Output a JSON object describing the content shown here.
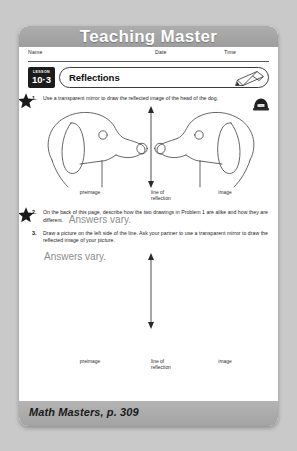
{
  "banner": {
    "title": "Teaching Master"
  },
  "fields": {
    "name_label": "Name",
    "date_label": "Date",
    "time_label": "Time"
  },
  "lesson": {
    "word": "LESSON",
    "number": "10·3",
    "title": "Reflections",
    "pencil_icon": "pencil-icon"
  },
  "problems": [
    {
      "number": "1.",
      "text": "Use a transparent mirror to draw the reflected image of the head of the dog.",
      "icon": "transparent-mirror-icon"
    },
    {
      "number": "2.",
      "text": "On the back of this page, describe how the two drawings in Problem 1 are alike and how they are different.",
      "answer": "Answers vary."
    },
    {
      "number": "3.",
      "text": "Draw a picture on the left side of the line. Ask your partner to use a transparent mirror to draw the reflected image of your picture.",
      "answer": "Answers vary."
    }
  ],
  "diagram_labels": {
    "preimage": "preimage",
    "line_of": "line of",
    "reflection": "reflection",
    "image": "image"
  },
  "footer": {
    "text": "Math Masters, p. 309"
  },
  "colors": {
    "page_background": "#c9c9c9",
    "banner_gray": "#a5a5a5",
    "footer_gray": "#ababab",
    "sheet_white": "#ffffff",
    "answer_gray": "#8e8e8e",
    "ink_black": "#1b1b1b"
  }
}
